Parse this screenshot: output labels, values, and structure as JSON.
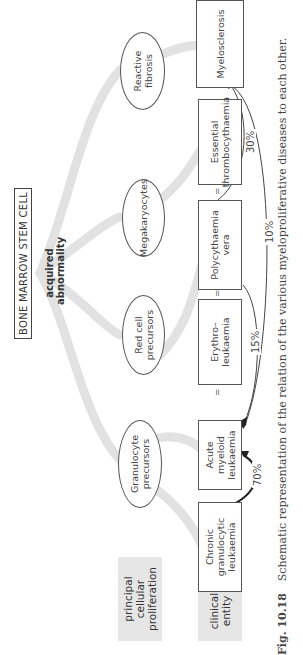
{
  "figure": {
    "orientation": "rotated-90-ccw",
    "root": {
      "label": "BONE MARROW STEM CELL",
      "annotation": "acquired\nabnormality"
    },
    "row_labels": {
      "proliferation": "principal cellular\nproliferation",
      "clinical": "clinical\nentity"
    },
    "proliferations": [
      {
        "id": "granulocyte",
        "label": "Granulocyte\nprecursors"
      },
      {
        "id": "redcell",
        "label": "Red cell\nprecursors"
      },
      {
        "id": "megakaryocytes",
        "label": "Megakaryocytes"
      },
      {
        "id": "fibrosis",
        "label": "Reactive\nfibrosis"
      }
    ],
    "entities": [
      {
        "id": "cgl",
        "label": "Chronic\ngranulocytic\nleukaemia"
      },
      {
        "id": "aml",
        "label": "Acute\nmyeloid\nleukaemia"
      },
      {
        "id": "erythro",
        "label": "Erythro–\nleukaemia"
      },
      {
        "id": "pv",
        "label": "Polycythaemia\nvera"
      },
      {
        "id": "et",
        "label": "Essential\nthrombocythaemia"
      },
      {
        "id": "myelo",
        "label": "Myelosclerosis"
      }
    ],
    "equivalence_marks": [
      "=",
      "=",
      "="
    ],
    "transitions": [
      {
        "from": "Chronic granulocytic leukaemia",
        "to": "Acute myeloid leukaemia",
        "label": "70%"
      },
      {
        "from": "Polycythaemia vera",
        "to": "Acute myeloid leukaemia",
        "label": "15%"
      },
      {
        "from": "Polycythaemia vera",
        "to": "Myelosclerosis",
        "label": "30%"
      },
      {
        "from": "Myelosclerosis",
        "to": "Acute myeloid leukaemia",
        "label": "10%"
      }
    ],
    "caption": {
      "number": "Fig. 10.18",
      "text": "Schematic representation of the relation of the various myeloproliferative diseases to each other."
    }
  }
}
